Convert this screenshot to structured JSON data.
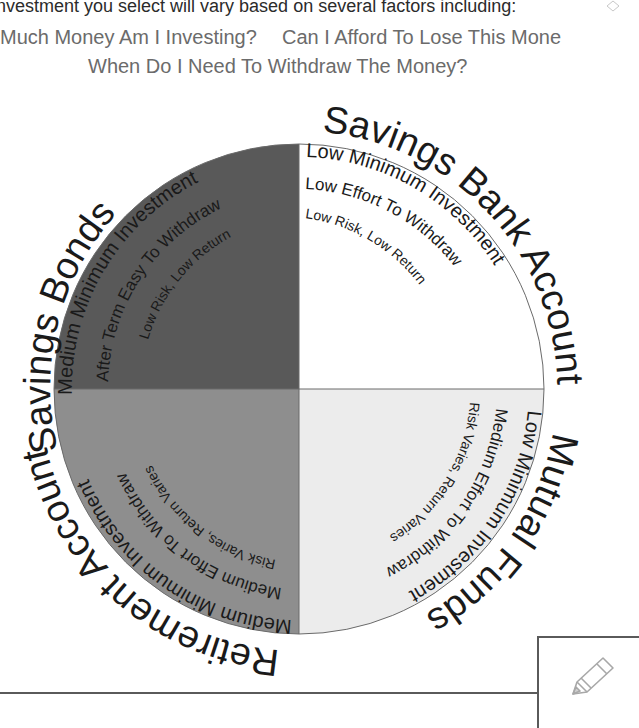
{
  "intro_text": "nvestment you select will vary based on several factors including:",
  "questions": [
    "Much Money Am I Investing?",
    "Can I Afford To Lose This Mone",
    "When Do I Need To Withdraw The Money?"
  ],
  "colors": {
    "savings_bonds": "#595959",
    "savings_bank_account": "#ffffff",
    "mutual_funds": "#ececec",
    "retirement_account": "#8e8e8e",
    "text": "#1a1a1a"
  },
  "quadrants": [
    {
      "name": "Savings Bonds",
      "position": "top-left",
      "lines": [
        "Medium Minimum Investment",
        "After Term Easy To Withdraw",
        "Low Risk, Low Return"
      ]
    },
    {
      "name": "Savings Bank Account",
      "position": "top-right",
      "lines": [
        "Low Minimum Investment",
        "Low Effort To Withdraw",
        "Low Risk, Low Return"
      ]
    },
    {
      "name": "Mutual Funds",
      "position": "bottom-right",
      "lines": [
        "Low Minimum Investment",
        "Medium Effort To Withdraw",
        "Risk Varies, Return Varies"
      ]
    },
    {
      "name": "Retirement Account",
      "position": "bottom-left",
      "lines": [
        "Medium Minimum Investment",
        "Medium Effort To Withdraw",
        "Risk Varies, Return Varies"
      ]
    }
  ],
  "icons": {
    "corner": "diamond-icon",
    "note": "pencil-icon"
  }
}
